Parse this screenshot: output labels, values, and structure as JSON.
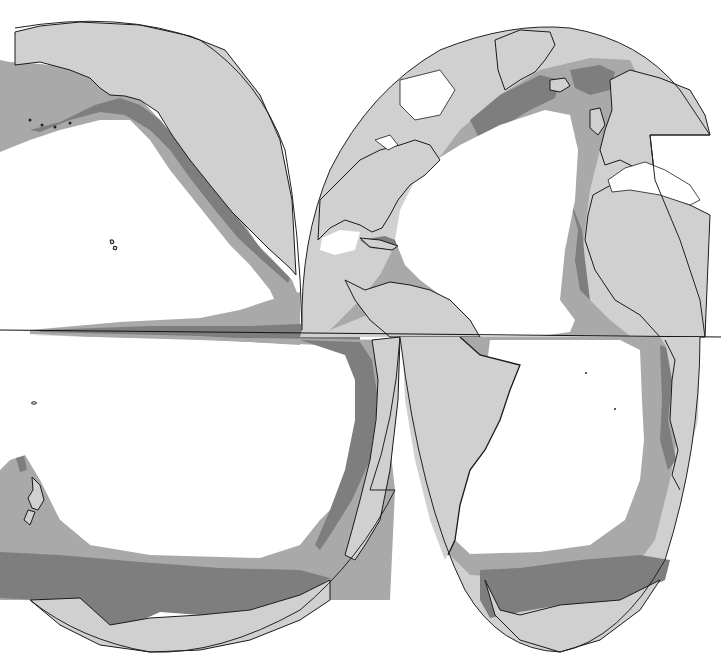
{
  "map": {
    "type": "interrupted world map (ocean zones)",
    "projection": "interrupted, ocean-centered lobes",
    "legend": [],
    "colors": {
      "ocean_open": "#ffffff",
      "land": "#d0d0d0",
      "zone_moderate": "#a9a9a9",
      "zone_high": "#7e7e7e",
      "outline": "#1a1a1a"
    },
    "lobes": [
      {
        "name": "North Pacific",
        "regions": [
          "Alaska",
          "Aleutian Islands",
          "Hawaii",
          "West coast of North America"
        ]
      },
      {
        "name": "North Atlantic",
        "regions": [
          "Greenland",
          "Iceland",
          "Europe",
          "North America east coast",
          "Caribbean",
          "West Africa",
          "Mediterranean"
        ]
      },
      {
        "name": "South Pacific",
        "regions": [
          "New Zealand",
          "West coast of South America",
          "Antarctica"
        ]
      },
      {
        "name": "South Atlantic",
        "regions": [
          "South America east coast",
          "Southern Africa",
          "Antarctica"
        ]
      }
    ],
    "equator": true
  }
}
